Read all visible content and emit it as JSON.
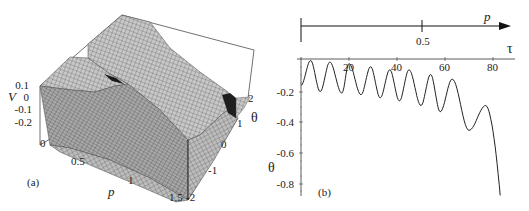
{
  "chart_data": [
    {
      "panel": "(a)",
      "type": "surface3d",
      "title": "",
      "zlabel": "V",
      "xlabel": "p",
      "ylabel": "θ",
      "z_ticks": [
        "0.1",
        "0",
        "-0.1",
        "-0.2"
      ],
      "x_ticks": [
        "0",
        "0.5",
        "1",
        "1.5"
      ],
      "y_ticks": [
        "-2",
        "-1",
        "0",
        "1",
        "2"
      ],
      "xlim": [
        0,
        1.5
      ],
      "ylim": [
        -2,
        2
      ],
      "zlim": [
        -0.25,
        0.1
      ],
      "grid": false,
      "mesh": true
    },
    {
      "panel": "(b)",
      "type": "line",
      "title": "",
      "xlabel": "τ",
      "ylabel": "θ",
      "top_axis_label": "p",
      "top_axis_ticks": [
        "0.5"
      ],
      "x_ticks": [
        "20",
        "40",
        "60",
        "80"
      ],
      "y_ticks": [
        "-0.2",
        "-0.4",
        "-0.6",
        "-0.8"
      ],
      "xlim": [
        0,
        85
      ],
      "ylim": [
        -0.85,
        0
      ],
      "grid": false,
      "series": [
        {
          "name": "θ(τ)",
          "extrema": [
            {
              "tau": 0,
              "theta": -0.17
            },
            {
              "tau": 4,
              "theta": -0.01
            },
            {
              "tau": 8,
              "theta": -0.21
            },
            {
              "tau": 12,
              "theta": -0.02
            },
            {
              "tau": 17,
              "theta": -0.22
            },
            {
              "tau": 20,
              "theta": -0.03
            },
            {
              "tau": 25,
              "theta": -0.23
            },
            {
              "tau": 29,
              "theta": -0.05
            },
            {
              "tau": 33,
              "theta": -0.25
            },
            {
              "tau": 37,
              "theta": -0.07
            },
            {
              "tau": 41,
              "theta": -0.27
            },
            {
              "tau": 45,
              "theta": -0.07
            },
            {
              "tau": 50,
              "theta": -0.3
            },
            {
              "tau": 54,
              "theta": -0.1
            },
            {
              "tau": 58,
              "theta": -0.34
            },
            {
              "tau": 63,
              "theta": -0.13
            },
            {
              "tau": 70,
              "theta": -0.46
            },
            {
              "tau": 77,
              "theta": -0.3
            },
            {
              "tau": 83,
              "theta": -0.88
            }
          ]
        }
      ]
    }
  ],
  "labels": {
    "panel_a": "(a)",
    "panel_b": "(b)",
    "a_V": "V",
    "a_p": "p",
    "a_theta": "θ",
    "a_z_0_1": "0.1",
    "a_z_0": "0",
    "a_z_m0_1": "-0.1",
    "a_z_m0_2": "-0.2",
    "a_x_0": "0",
    "a_x_0_5": "0.5",
    "a_x_1": "1",
    "a_x_1_5": "1.5",
    "a_y_m2": "-2",
    "a_y_m1": "-1",
    "a_y_0": "0",
    "a_y_1": "1",
    "a_y_2": "2",
    "b_p": "p",
    "b_p_0_5": "0.5",
    "b_tau": "τ",
    "b_theta": "θ",
    "b_x_20": "20",
    "b_x_40": "40",
    "b_x_60": "60",
    "b_x_80": "80",
    "b_y_m0_2": "-0.2",
    "b_y_m0_4": "-0.4",
    "b_y_m0_6": "-0.6",
    "b_y_m0_8": "-0.8"
  }
}
